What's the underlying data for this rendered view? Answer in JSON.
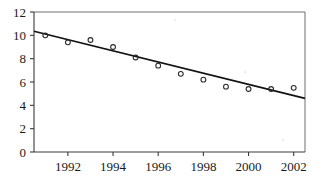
{
  "chart_data": {
    "type": "scatter",
    "title": "",
    "subtitle": "",
    "xlabel": "",
    "ylabel": "",
    "xlim": [
      1990.5,
      2002.5
    ],
    "ylim": [
      0,
      12
    ],
    "grid": false,
    "legend": null,
    "x": [
      1991,
      1992,
      1993,
      1994,
      1995,
      1996,
      1997,
      1998,
      1999,
      2000,
      2001,
      2002
    ],
    "values": [
      10.0,
      9.4,
      9.6,
      9.0,
      8.1,
      7.4,
      6.7,
      6.2,
      5.6,
      5.4,
      5.4,
      5.5
    ],
    "series": [
      {
        "name": "observations",
        "type": "scatter",
        "marker": "open-circle",
        "values": [
          10.0,
          9.4,
          9.6,
          9.0,
          8.1,
          7.4,
          6.7,
          6.2,
          5.6,
          5.4,
          5.4,
          5.5
        ]
      },
      {
        "name": "trend-line",
        "type": "line",
        "endpoints": [
          {
            "x": 1990.5,
            "y": 10.35
          },
          {
            "x": 2002.5,
            "y": 4.6
          }
        ]
      }
    ],
    "x_ticks": [
      1992,
      1994,
      1996,
      1998,
      2000,
      2002
    ],
    "x_tick_labels": [
      "1992",
      "1994",
      "1996",
      "1998",
      "2000",
      "2002"
    ],
    "y_ticks": [
      0,
      2,
      4,
      6,
      8,
      10,
      12
    ],
    "y_tick_labels": [
      "0",
      "2",
      "4",
      "6",
      "8",
      "10",
      "12"
    ],
    "colors": {
      "line": "#111111",
      "marker": "#2a2a2a",
      "axis": "#3a3a3a",
      "frame": "#6e6e6e",
      "background": "#ffffff"
    }
  }
}
